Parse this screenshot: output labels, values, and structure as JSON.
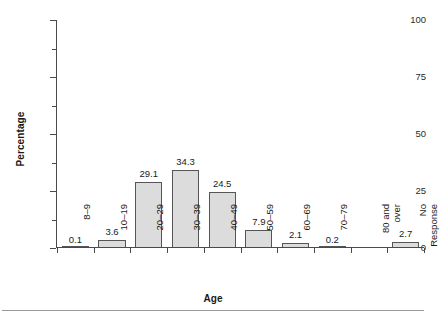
{
  "chart_data": {
    "type": "bar",
    "title": "",
    "subtitle": "",
    "xlabel": "Age",
    "ylabel": "Percentage",
    "categories": [
      "8–9",
      "10–19",
      "20–29",
      "30–39",
      "40–49",
      "50–59",
      "60–69",
      "70–79",
      "80 and over",
      "No Response"
    ],
    "category_lines": [
      [
        "8–9"
      ],
      [
        "10–19"
      ],
      [
        "20–29"
      ],
      [
        "30–39"
      ],
      [
        "40–49"
      ],
      [
        "50–59"
      ],
      [
        "60–69"
      ],
      [
        "70–79"
      ],
      [
        "80 and",
        "over"
      ],
      [
        "No",
        "Response"
      ]
    ],
    "values": [
      0.1,
      3.6,
      29.1,
      34.3,
      24.5,
      7.9,
      2.1,
      0.2,
      null,
      2.7
    ],
    "value_labels": [
      "0.1",
      "3.6",
      "29.1",
      "34.3",
      "24.5",
      "7.9",
      "2.1",
      "0.2",
      "",
      "2.7"
    ],
    "ylim": [
      0,
      100
    ],
    "yticks": [
      0,
      25,
      50,
      75,
      100
    ],
    "ytick_labels": [
      "0",
      "25",
      "50",
      "75",
      "100"
    ],
    "yminor_ticks": [
      12.5,
      37.5,
      62.5,
      87.5
    ],
    "grid": false,
    "legend": null,
    "bar_fill_color": "#dcdcdc",
    "bar_edge_color": "#555555",
    "axis_color": "#4a4a4a",
    "background_color": "#ffffff"
  },
  "figure": {
    "y_axis_title": "Percentage",
    "x_axis_title": "Age"
  }
}
